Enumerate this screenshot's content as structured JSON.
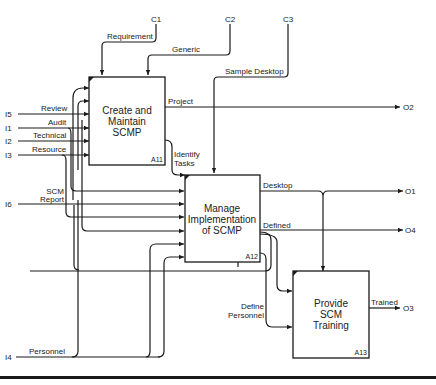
{
  "diagram": {
    "type": "IDEF0",
    "boxes": [
      {
        "id": "A11",
        "lines": [
          "Create and",
          "Maintain",
          "SCMP"
        ]
      },
      {
        "id": "A12",
        "lines": [
          "Manage",
          "Implementation",
          "of SCMP"
        ]
      },
      {
        "id": "A13",
        "lines": [
          "Provide",
          "SCM",
          "Training"
        ]
      }
    ],
    "controls": [
      {
        "code": "C1",
        "label": "Requirement"
      },
      {
        "code": "C2",
        "label": "Generic"
      },
      {
        "code": "C3",
        "label": "Sample Desktop"
      }
    ],
    "inputs": [
      {
        "code": "I5",
        "label": "Review"
      },
      {
        "code": "I1",
        "label": "Audit"
      },
      {
        "code": "I2",
        "label": "Technical"
      },
      {
        "code": "I3",
        "label": "Resource"
      },
      {
        "code": "I6",
        "label": "SCM Report",
        "lines": [
          "SCM",
          "Report"
        ]
      },
      {
        "code": "I4",
        "label": "Personnel"
      }
    ],
    "outputs": [
      {
        "code": "O2",
        "label": "Project"
      },
      {
        "code": "O1",
        "label": "Desktop"
      },
      {
        "code": "O4",
        "label": "Defined"
      },
      {
        "code": "O3",
        "label": "Trained"
      }
    ],
    "internal_labels": {
      "identify_tasks": [
        "Identify",
        "Tasks"
      ],
      "define_personnel": [
        "Define",
        "Personnel"
      ]
    }
  }
}
